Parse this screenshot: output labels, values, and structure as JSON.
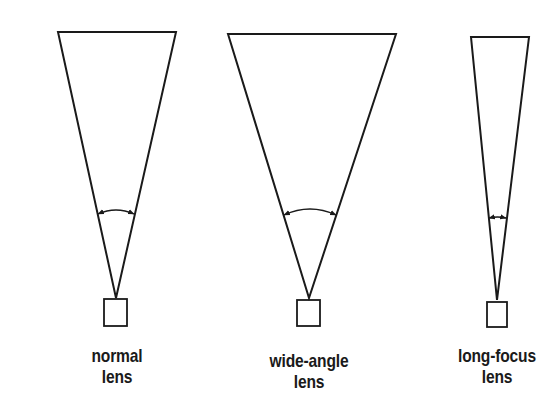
{
  "diagram": {
    "stroke_color": "#1a1a1a",
    "background_color": "#ffffff",
    "lenses": [
      {
        "id": "normal",
        "label_line1": "normal",
        "label_line2": "lens",
        "top_left": [
          58,
          32
        ],
        "top_right": [
          176,
          32
        ],
        "apex": [
          116,
          298
        ],
        "arc": {
          "x1": 98,
          "x2": 134,
          "y": 214,
          "bulge": 4
        },
        "camera": {
          "x": 104,
          "y": 299,
          "w": 23,
          "h": 27
        },
        "label_pos": {
          "x": 62,
          "y": 345,
          "w": 110
        }
      },
      {
        "id": "wide-angle",
        "label_line1": "wide-angle",
        "label_line2": "lens",
        "top_left": [
          228,
          34
        ],
        "top_right": [
          396,
          34
        ],
        "apex": [
          309,
          298
        ],
        "arc": {
          "x1": 284,
          "x2": 336,
          "y": 215,
          "bulge": 6
        },
        "camera": {
          "x": 297,
          "y": 300,
          "w": 23,
          "h": 26
        },
        "label_pos": {
          "x": 244,
          "y": 350,
          "w": 130
        }
      },
      {
        "id": "long-focus",
        "label_line1": "long-focus",
        "label_line2": "lens",
        "top_left": [
          471,
          37
        ],
        "top_right": [
          529,
          37
        ],
        "apex": [
          497,
          300
        ],
        "arc": {
          "x1": 489,
          "x2": 506,
          "y": 218,
          "bulge": 1
        },
        "camera": {
          "x": 487,
          "y": 302,
          "w": 20,
          "h": 25
        },
        "label_pos": {
          "x": 432,
          "y": 345,
          "w": 130
        }
      }
    ]
  }
}
